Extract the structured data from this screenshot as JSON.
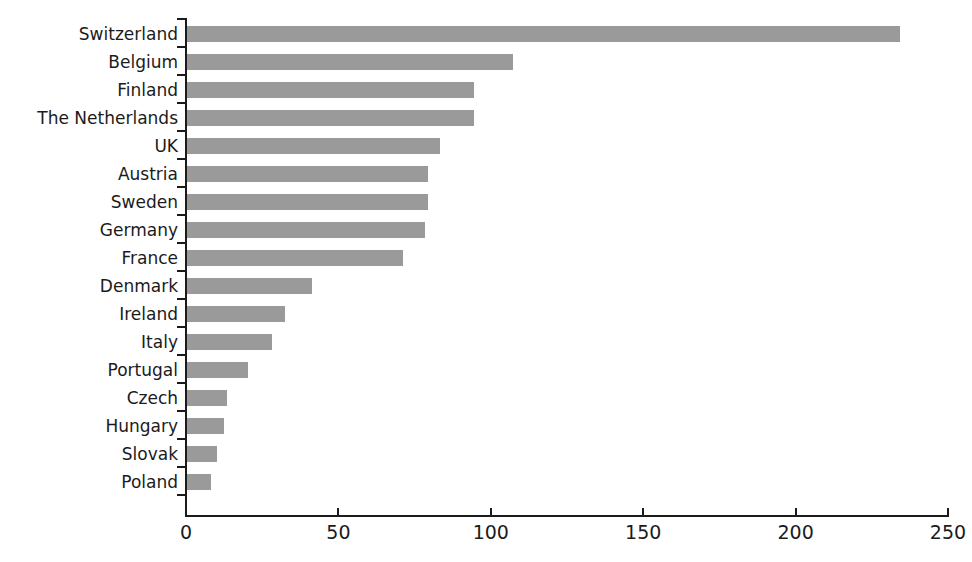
{
  "chart_data": {
    "type": "bar",
    "orientation": "horizontal",
    "title": "",
    "subtitle": "",
    "xlabel": "",
    "ylabel": "",
    "xlim": [
      0,
      250
    ],
    "ylim": null,
    "grid": false,
    "legend": null,
    "legend_position": "none",
    "xticks": [
      0,
      50,
      100,
      150,
      200,
      250
    ],
    "xtick_labels": [
      "0",
      "50",
      "100",
      "150",
      "200",
      "250"
    ],
    "categories": [
      "Switzerland",
      "Belgium",
      "Finland",
      "The Netherlands",
      "UK",
      "Austria",
      "Sweden",
      "Germany",
      "France",
      "Denmark",
      "Ireland",
      "Italy",
      "Portugal",
      "Czech",
      "Hungary",
      "Slovak",
      "Poland"
    ],
    "values": [
      234,
      107,
      94,
      94,
      83,
      79,
      79,
      78,
      71,
      41,
      32,
      28,
      20,
      13,
      12,
      10,
      8
    ],
    "bar_color": "#9a9a9a",
    "axis_color": "#1b1b1b",
    "background_color": "#ffffff",
    "annotations": []
  }
}
